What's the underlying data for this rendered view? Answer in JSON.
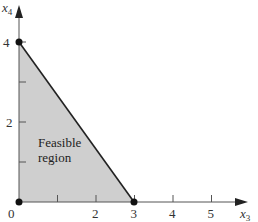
{
  "diagram": {
    "type": "linear-programming-feasible-region",
    "axes": {
      "x": {
        "label": "x",
        "subscript": "3",
        "ticks": [
          "0",
          "2",
          "3",
          "4",
          "5"
        ],
        "minor_ticks": [
          1,
          2,
          3,
          4,
          5
        ]
      },
      "y": {
        "label": "x",
        "subscript": "4",
        "ticks": [
          "4",
          "2"
        ],
        "minor_ticks": [
          1,
          2,
          3,
          4
        ]
      }
    },
    "region": {
      "label_line1": "Feasible",
      "label_line2": "region",
      "vertices": [
        [
          0,
          0
        ],
        [
          0,
          4
        ],
        [
          3,
          0
        ]
      ],
      "fill_color": "#cfcfcf"
    },
    "corner_points": [
      [
        0,
        0
      ],
      [
        0,
        4
      ],
      [
        3,
        0
      ]
    ],
    "colors": {
      "line": "#222222",
      "axis": "#555555",
      "point": "#111111"
    }
  }
}
